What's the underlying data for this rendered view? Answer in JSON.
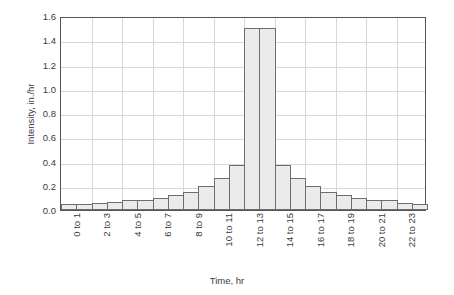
{
  "chart_data": {
    "type": "bar",
    "title": "",
    "xlabel": "Time, hr",
    "ylabel": "Intensity, in./hr",
    "ylim": [
      0,
      1.6
    ],
    "ytick_step": 0.2,
    "yticks": [
      "0.0",
      "0.2",
      "0.4",
      "0.6",
      "0.8",
      "1.0",
      "1.2",
      "1.4",
      "1.6"
    ],
    "grid": true,
    "legend": "none",
    "bar_fill": "#ebebeb",
    "bar_edge": "#6d6d6d",
    "grid_color": "#d7d7d7",
    "axis_color": "#555555",
    "categories": [
      "0 to 1",
      "1 to 2",
      "2 to 3",
      "3 to 4",
      "4 to 5",
      "5 to 6",
      "6 to 7",
      "7 to 8",
      "8 to 9",
      "9 to 10",
      "10 to 11",
      "11 to 12",
      "12 to 13",
      "13 to 14",
      "14 to 15",
      "15 to 16",
      "16 to 17",
      "17 to 18",
      "18 to 19",
      "19 to 20",
      "20 to 21",
      "21 to 22",
      "22 to 23",
      "23 to 24"
    ],
    "xtick_labels": [
      "0 to 1",
      "2 to 3",
      "4 to 5",
      "6 to 7",
      "8 to 9",
      "10 to 11",
      "12 to 13",
      "14 to 15",
      "16 to 17",
      "18 to 19",
      "20 to 21",
      "22 to 23"
    ],
    "xtick_indices": [
      0,
      2,
      4,
      6,
      8,
      10,
      12,
      14,
      16,
      18,
      20,
      22
    ],
    "values": [
      0.05,
      0.05,
      0.06,
      0.07,
      0.08,
      0.08,
      0.1,
      0.12,
      0.15,
      0.2,
      0.26,
      0.37,
      1.5,
      1.5,
      0.37,
      0.26,
      0.2,
      0.15,
      0.12,
      0.1,
      0.08,
      0.08,
      0.06,
      0.05
    ]
  }
}
